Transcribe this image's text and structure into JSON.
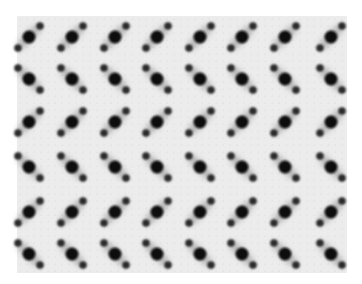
{
  "image": {
    "description": "Grayscale micrograph of a periodic lattice of diffraction spot triplets",
    "background_color": "#ececec",
    "spot_color": "#111111",
    "satellite_color": "#2a2a2a"
  },
  "lattice": {
    "rows": 6,
    "cols": 8,
    "col_centers": [
      29,
      72,
      115,
      157,
      200,
      242,
      285,
      331
    ],
    "row_centers": [
      37,
      79,
      122,
      167,
      212,
      254
    ],
    "row_orientation": [
      "up-right",
      "down-right",
      "up-right",
      "down-right",
      "up-right",
      "down-right"
    ],
    "main_radius": 6.5,
    "satellite_radius": 3.8,
    "satellite_offset": [
      11,
      11
    ]
  }
}
